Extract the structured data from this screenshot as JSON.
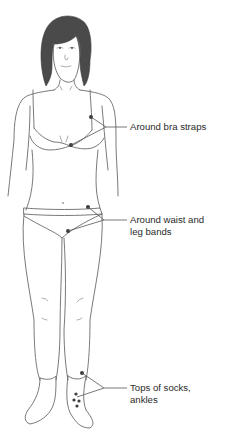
{
  "figure": {
    "type": "anatomical-diagram",
    "line_color": "#6a6a6a",
    "marker_color": "#3c3c3c",
    "text_color": "#2a2a2a"
  },
  "labels": [
    {
      "id": "bra",
      "lines": [
        "Around bra straps"
      ]
    },
    {
      "id": "waist",
      "lines": [
        "Around waist and",
        "leg bands"
      ]
    },
    {
      "id": "socks",
      "lines": [
        "Tops of socks,",
        "ankles"
      ]
    }
  ]
}
